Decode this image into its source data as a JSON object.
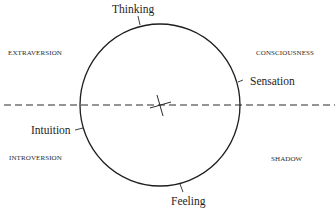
{
  "diagram": {
    "functions": {
      "top": "Thinking",
      "right": "Sensation",
      "left": "Intuition",
      "bottom": "Feeling"
    },
    "quadrant_labels": {
      "top_left": "EXTRAVERSION",
      "top_right": "CONSCIOUSNESS",
      "bottom_left": "INTROVERSION",
      "bottom_right": "SHADOW"
    },
    "colors": {
      "line": "#1e1e1e",
      "background": "#ffffff"
    }
  }
}
